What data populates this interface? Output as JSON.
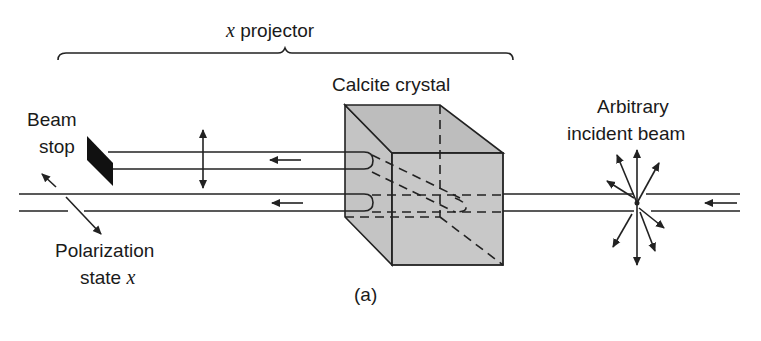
{
  "figure": {
    "caption": "(a)",
    "bracket_label_var": "x",
    "bracket_label_text": " projector",
    "crystal_label": "Calcite crystal",
    "beam_stop_label_line1": "Beam",
    "beam_stop_label_line2": "stop",
    "incident_label_line1": "Arbitrary",
    "incident_label_line2": "incident beam",
    "polarization_label_line1": "Polarization",
    "polarization_label_line2_text": "state ",
    "polarization_label_line2_var": "x"
  },
  "colors": {
    "crystal_fill": "#c8c8c8",
    "crystal_top_fill": "#bdbdbd",
    "line": "#222222",
    "beam_stop": "#111111",
    "background": "#ffffff"
  }
}
